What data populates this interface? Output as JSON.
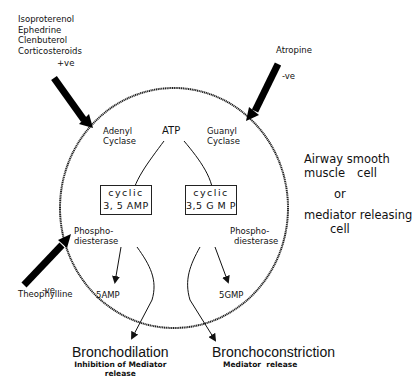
{
  "diagram": {
    "type": "pharmacology-pathway",
    "cell": {
      "line1": "Airway smooth",
      "line2a": "muscle",
      "line2b": "cell",
      "line3": "or",
      "line4": "mediator releasing",
      "line5": "cell"
    },
    "stimulants": {
      "drugs": [
        "Isoproterenol",
        "Ephedrine",
        "Clenbuterol",
        "Corticosteroids"
      ],
      "effect": "+ve"
    },
    "atropine": {
      "label": "Atropine",
      "effect": "-ve"
    },
    "theophylline": {
      "label": "Theophylline",
      "effect": "-ve"
    },
    "substrate": "ATP",
    "enzymes": {
      "adenyl_1": "Adenyl",
      "adenyl_2": "Cyclase",
      "guanyl_1": "Guanyl",
      "guanyl_2": "Cyclase",
      "pde_left_1": "Phospho-",
      "pde_left_2": "diesterase",
      "pde_right_1": "Phospho-",
      "pde_right_2": "diesterase"
    },
    "camp_box": {
      "line1": "cyclic",
      "line2": "3, 5 AMP"
    },
    "cgmp_box": {
      "line1": "cyclic",
      "line2": "3,5 G M P"
    },
    "products": {
      "left": "5AMP",
      "right": "5GMP"
    },
    "outcomes": {
      "left_title": "Bronchodilation",
      "left_sub1": "Inhibition of Mediator",
      "left_sub2": "release",
      "right_title": "Bronchoconstriction",
      "right_sub": "Mediator  release"
    },
    "colors": {
      "ink": "#111111",
      "background": "#ffffff"
    }
  }
}
